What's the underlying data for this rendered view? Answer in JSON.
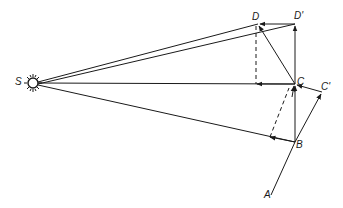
{
  "diagram": {
    "type": "vector-geometry",
    "labels": {
      "S": "S",
      "D": "D",
      "D_prime": "D'",
      "C": "C",
      "C_prime": "C'",
      "B": "B",
      "A": "A"
    },
    "points": {
      "S": [
        33,
        83
      ],
      "D": [
        258,
        24
      ],
      "D_prime": [
        295,
        24
      ],
      "C": [
        295,
        84
      ],
      "C_prime": [
        322,
        92
      ],
      "B": [
        295,
        142
      ],
      "A": [
        271,
        195
      ]
    },
    "colors": {
      "ink": "#1a1a1a",
      "background": "#ffffff"
    }
  }
}
